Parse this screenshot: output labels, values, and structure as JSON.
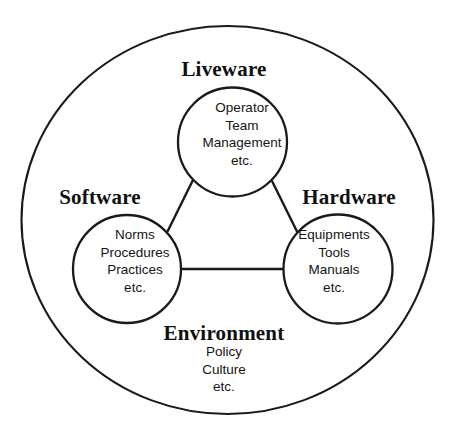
{
  "diagram": {
    "title_model": "SHELL Model",
    "outer": {
      "label": "Environment",
      "items": [
        "Policy",
        "Culture",
        "etc."
      ]
    },
    "nodes": [
      {
        "id": "liveware",
        "label": "Liveware",
        "items": [
          "Operator",
          "Team",
          "Management",
          "etc."
        ]
      },
      {
        "id": "software",
        "label": "Software",
        "items": [
          "Norms",
          "Procedures",
          "Practices",
          "etc."
        ]
      },
      {
        "id": "hardware",
        "label": "Hardware",
        "items": [
          "Equipments",
          "Tools",
          "Manuals",
          "etc."
        ]
      }
    ],
    "connectors": [
      {
        "from": "software",
        "to": "liveware"
      },
      {
        "from": "liveware",
        "to": "hardware"
      },
      {
        "from": "software",
        "to": "hardware"
      }
    ],
    "colors": {
      "stroke": "#1a1a1a",
      "background": "#ffffff",
      "text": "#141414"
    }
  }
}
